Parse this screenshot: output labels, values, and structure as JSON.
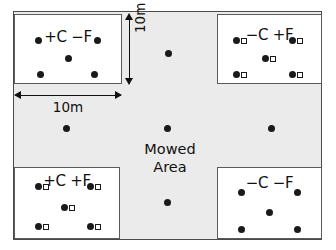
{
  "figure": {
    "background_color": "#ffffff",
    "field_fill_color": "#ebebeb",
    "plot_fill_color": "#ffffff",
    "marker_color": "#1a1a1a",
    "mowed_area_label_line1": "Mowed",
    "mowed_area_label_line2": "Area"
  },
  "dimensions": {
    "vertical_label": "10m",
    "horizontal_label": "10m"
  },
  "plots": [
    {
      "id": "top-left",
      "label": "+C −F",
      "carbon": "+C",
      "fertilizer": "−F",
      "has_open_squares": false,
      "x": 14,
      "y": 14,
      "w": 108,
      "h": 70,
      "label_top": 13,
      "markers": [
        {
          "x": 20,
          "y": 22,
          "square": false
        },
        {
          "x": 79,
          "y": 22,
          "square": false
        },
        {
          "x": 50,
          "y": 40,
          "square": false
        },
        {
          "x": 22,
          "y": 56,
          "square": false
        },
        {
          "x": 76,
          "y": 56,
          "square": false
        }
      ]
    },
    {
      "id": "top-right",
      "label": "−C +F",
      "carbon": "−C",
      "fertilizer": "+F",
      "has_open_squares": true,
      "x": 217,
      "y": 14,
      "w": 105,
      "h": 70,
      "label_top": 11,
      "markers": [
        {
          "x": 15,
          "y": 22,
          "square": true
        },
        {
          "x": 71,
          "y": 22,
          "square": true
        },
        {
          "x": 44,
          "y": 40,
          "square": true
        },
        {
          "x": 15,
          "y": 56,
          "square": true
        },
        {
          "x": 71,
          "y": 56,
          "square": true
        }
      ]
    },
    {
      "id": "bottom-left",
      "label": "+C +F",
      "carbon": "+C",
      "fertilizer": "+F",
      "has_open_squares": true,
      "x": 14,
      "y": 167,
      "w": 106,
      "h": 72,
      "label_top": 4,
      "markers": [
        {
          "x": 20,
          "y": 15,
          "square": true
        },
        {
          "x": 72,
          "y": 15,
          "square": true
        },
        {
          "x": 46,
          "y": 36,
          "square": true
        },
        {
          "x": 20,
          "y": 55,
          "square": true
        },
        {
          "x": 72,
          "y": 55,
          "square": true
        }
      ]
    },
    {
      "id": "bottom-right",
      "label": "−C −F",
      "carbon": "−C",
      "fertilizer": "−F",
      "has_open_squares": false,
      "x": 217,
      "y": 167,
      "w": 105,
      "h": 72,
      "label_top": 6,
      "markers": [
        {
          "x": 20,
          "y": 21,
          "square": false
        },
        {
          "x": 76,
          "y": 21,
          "square": false
        },
        {
          "x": 48,
          "y": 41,
          "square": false
        },
        {
          "x": 20,
          "y": 58,
          "square": false
        },
        {
          "x": 76,
          "y": 58,
          "square": false
        }
      ]
    }
  ],
  "field_markers": [
    {
      "x": 168,
      "y": 53
    },
    {
      "x": 66,
      "y": 128
    },
    {
      "x": 167,
      "y": 128
    },
    {
      "x": 271,
      "y": 128
    },
    {
      "x": 167,
      "y": 202
    }
  ]
}
